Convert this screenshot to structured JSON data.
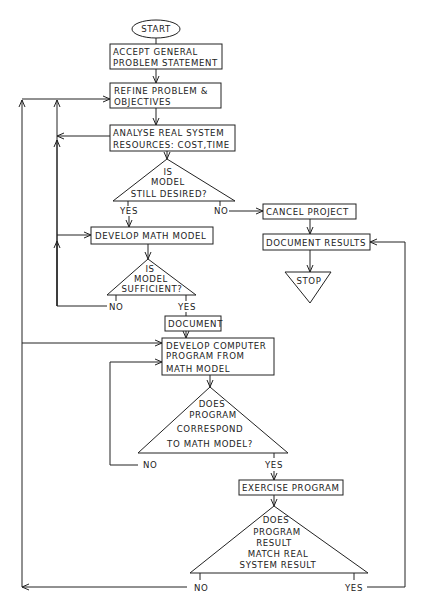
{
  "diagram": {
    "type": "flowchart",
    "nodes": {
      "start": {
        "label": "START",
        "shape": "oval"
      },
      "accept": {
        "lines": [
          "ACCEPT GENERAL",
          "PROBLEM STATEMENT"
        ],
        "shape": "box"
      },
      "refine": {
        "lines": [
          "REFINE PROBLEM &",
          "OBJECTIVES"
        ],
        "shape": "box"
      },
      "analyse": {
        "lines": [
          "ANALYSE REAL SYSTEM",
          "RESOURCES: COST,TIME"
        ],
        "shape": "box"
      },
      "decision_desired": {
        "lines": [
          "IS",
          "MODEL",
          "STILL DESIRED?"
        ],
        "shape": "triangle",
        "yes": "YES",
        "no": "NO"
      },
      "cancel": {
        "label": "CANCEL PROJECT",
        "shape": "box"
      },
      "document_results": {
        "label": "DOCUMENT RESULTS",
        "shape": "box"
      },
      "stop": {
        "label": "STOP",
        "shape": "inverted-triangle"
      },
      "develop_math": {
        "label": "DEVELOP MATH MODEL",
        "shape": "box"
      },
      "decision_sufficient": {
        "lines": [
          "IS",
          "MODEL",
          "SUFFICIENT?"
        ],
        "shape": "triangle",
        "yes": "YES",
        "no": "NO"
      },
      "document": {
        "label": "DOCUMENT",
        "shape": "box"
      },
      "develop_program": {
        "lines": [
          "DEVELOP COMPUTER",
          "PROGRAM FROM",
          "MATH MODEL"
        ],
        "shape": "box"
      },
      "decision_correspond": {
        "lines": [
          "DOES",
          "PROGRAM",
          "CORRESPOND",
          "TO MATH MODEL?"
        ],
        "shape": "triangle",
        "yes": "YES",
        "no": "NO"
      },
      "exercise": {
        "label": "EXERCISE PROGRAM",
        "shape": "box"
      },
      "decision_match": {
        "lines": [
          "DOES",
          "PROGRAM",
          "RESULT",
          "MATCH REAL",
          "SYSTEM RESULT"
        ],
        "shape": "triangle",
        "yes": "YES",
        "no": "NO"
      }
    },
    "edges": [
      {
        "from": "start",
        "to": "accept"
      },
      {
        "from": "accept",
        "to": "refine"
      },
      {
        "from": "refine",
        "to": "analyse"
      },
      {
        "from": "analyse",
        "to": "decision_desired"
      },
      {
        "from": "decision_desired",
        "to": "develop_math",
        "label": "YES"
      },
      {
        "from": "decision_desired",
        "to": "cancel",
        "label": "NO"
      },
      {
        "from": "cancel",
        "to": "document_results"
      },
      {
        "from": "document_results",
        "to": "stop"
      },
      {
        "from": "develop_math",
        "to": "decision_sufficient"
      },
      {
        "from": "decision_sufficient",
        "to": "document",
        "label": "YES"
      },
      {
        "from": "decision_sufficient",
        "to": "develop_math",
        "label": "NO"
      },
      {
        "from": "document",
        "to": "develop_program"
      },
      {
        "from": "develop_program",
        "to": "decision_correspond"
      },
      {
        "from": "decision_correspond",
        "to": "exercise",
        "label": "YES"
      },
      {
        "from": "decision_correspond",
        "to": "develop_program",
        "label": "NO"
      },
      {
        "from": "exercise",
        "to": "decision_match"
      },
      {
        "from": "decision_match",
        "to": "document_results",
        "label": "YES"
      },
      {
        "from": "decision_match",
        "to": "refine",
        "label": "NO"
      }
    ]
  }
}
